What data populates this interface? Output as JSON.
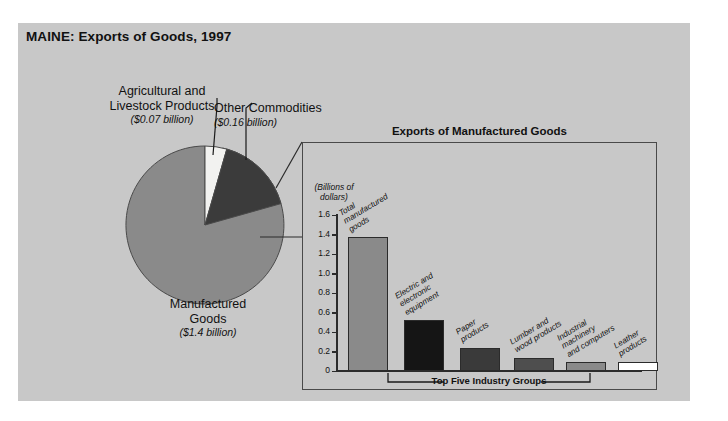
{
  "figure": {
    "title": "MAINE: Exports of Goods, 1997"
  },
  "pie": {
    "labels": {
      "agricultural": {
        "name": "Agricultural and\nLivestock Products",
        "line1": "Agricultural and",
        "line2": "Livestock Products",
        "value": "($0.07 billion)"
      },
      "other": {
        "line1": "Other Commodities",
        "value": "($0.16 billion)"
      },
      "manufactured": {
        "line1": "Manufactured",
        "line2": "Goods",
        "value": "($1.4 billion)"
      }
    }
  },
  "inset": {
    "title": "Exports of Manufactured Goods",
    "axis_unit_line1": "(Billions of",
    "axis_unit_line2": "dollars)",
    "bracket_label": "Top Five Industry Groups"
  },
  "chart_data": [
    {
      "type": "pie",
      "title": "MAINE: Exports of Goods, 1997",
      "unit": "billions of dollars",
      "categories": [
        "Agricultural and Livestock Products",
        "Other Commodities",
        "Manufactured Goods"
      ],
      "values": [
        0.07,
        0.16,
        1.4
      ],
      "value_labels": [
        "($0.07 billion)",
        "($0.16 billion)",
        "($1.4 billion)"
      ],
      "colors": [
        "#f2f2f0",
        "#3b3b3b",
        "#8a8a8a"
      ],
      "legend": "labels-with-callouts",
      "start_angle_deg": -90
    },
    {
      "type": "bar",
      "title": "Exports of Manufactured Goods",
      "ylabel": "(Billions of dollars)",
      "xlabel": "",
      "ylim": [
        0,
        1.6
      ],
      "yticks": [
        0,
        0.2,
        0.4,
        0.6,
        0.8,
        1.0,
        1.2,
        1.4,
        1.6
      ],
      "ytick_labels": [
        "0",
        "0.2",
        "0.4",
        "0.6",
        "0.8",
        "1.0",
        "1.2",
        "1.4",
        "1.6"
      ],
      "grid": false,
      "categories": [
        "Total manufactured goods",
        "Electric and electronic equipment",
        "Paper products",
        "Lumber and wood products",
        "Industrial machinery and computers",
        "Leather products"
      ],
      "values": [
        1.37,
        0.52,
        0.24,
        0.13,
        0.09,
        0.09
      ],
      "colors": [
        "#8a8a8a",
        "#151515",
        "#3a3a3a",
        "#4e4e4e",
        "#8a8a8a",
        "#ffffff"
      ],
      "annotation": "Top Five Industry Groups"
    }
  ],
  "bars": [
    {
      "label_lines": [
        "Total",
        "manufactured",
        "goods"
      ],
      "value": 1.37,
      "color": "#8a8a8a",
      "x": 10,
      "w": 40
    },
    {
      "label_lines": [
        "Electric and",
        "electronic",
        "equipment"
      ],
      "value": 0.52,
      "color": "#151515",
      "x": 66,
      "w": 40
    },
    {
      "label_lines": [
        "Paper",
        "products"
      ],
      "value": 0.24,
      "color": "#3a3a3a",
      "x": 122,
      "w": 40
    },
    {
      "label_lines": [
        "Lumber and",
        "wood products"
      ],
      "value": 0.13,
      "color": "#4e4e4e",
      "x": 176,
      "w": 40
    },
    {
      "label_lines": [
        "Industrial",
        "machinery",
        "and computers"
      ],
      "value": 0.09,
      "color": "#8a8a8a",
      "x": 228,
      "w": 40
    },
    {
      "label_lines": [
        "Leather",
        "products"
      ],
      "value": 0.09,
      "color": "#ffffff",
      "x": 280,
      "w": 40
    }
  ],
  "yticks": [
    "1.6",
    "1.4",
    "1.2",
    "1.0",
    "0.8",
    "0.6",
    "0.4",
    "0.2",
    "0"
  ]
}
